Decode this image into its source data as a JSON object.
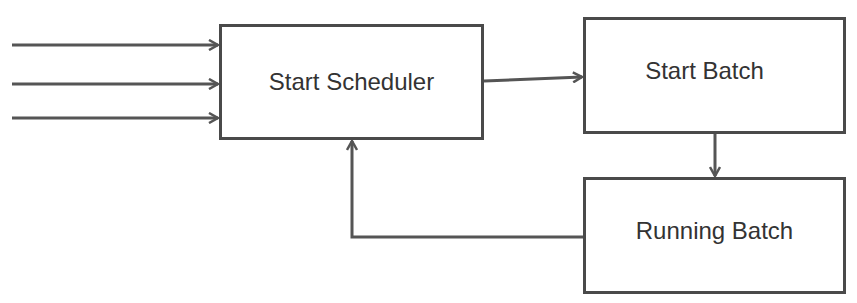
{
  "nodes": {
    "scheduler": {
      "label": "Start Scheduler"
    },
    "start_batch": {
      "label": "Start Batch"
    },
    "running_batch": {
      "label": "Running Batch"
    }
  },
  "edges": [
    {
      "from": "input-1",
      "to": "scheduler"
    },
    {
      "from": "input-2",
      "to": "scheduler"
    },
    {
      "from": "input-3",
      "to": "scheduler"
    },
    {
      "from": "scheduler",
      "to": "start_batch"
    },
    {
      "from": "start_batch",
      "to": "running_batch"
    },
    {
      "from": "running_batch",
      "to": "scheduler"
    }
  ],
  "colors": {
    "line": "#555555",
    "border": "#4a4a4a",
    "text": "#333333"
  }
}
